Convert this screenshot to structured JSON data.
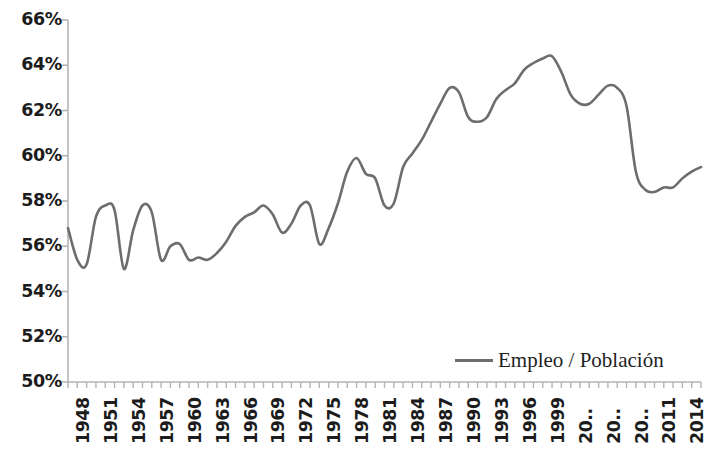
{
  "chart_data": {
    "type": "line",
    "title": "",
    "subtitle": "",
    "xlabel": "",
    "ylabel": "",
    "ylim": [
      50,
      66
    ],
    "xlim": [
      1948,
      2016
    ],
    "ytick_labels": [
      "66%",
      "64%",
      "62%",
      "60%",
      "58%",
      "56%",
      "54%",
      "52%",
      "50%"
    ],
    "ytick_values": [
      66,
      64,
      62,
      60,
      58,
      56,
      54,
      52,
      50
    ],
    "ytick_step": 2,
    "xtick_labels": [
      "1948",
      "1951",
      "1954",
      "1957",
      "1960",
      "1963",
      "1966",
      "1969",
      "1972",
      "1975",
      "1978",
      "1981",
      "1984",
      "1987",
      "1990",
      "1993",
      "1996",
      "1999",
      "20..",
      "20..",
      "20..",
      "2011",
      "2014"
    ],
    "xtick_years": [
      1948,
      1951,
      1954,
      1957,
      1960,
      1963,
      1966,
      1969,
      1972,
      1975,
      1978,
      1981,
      1984,
      1987,
      1990,
      1993,
      1996,
      1999,
      2002,
      2005,
      2008,
      2011,
      2014
    ],
    "xtick_label_rotation": -90,
    "minor_tick_interval_years": 1,
    "grid": false,
    "legend": {
      "position": "inside-bottom-right",
      "entries": [
        {
          "label": "Empleo / Población",
          "color": "#6d6d6d",
          "marker": "line"
        }
      ]
    },
    "line_color": "#6d6d6d",
    "line_width": 2.6,
    "axis_color": "#b5b5b5",
    "series": [
      {
        "name": "Empleo / Población",
        "x": [
          1948,
          1949,
          1950,
          1951,
          1952,
          1953,
          1954,
          1955,
          1956,
          1957,
          1958,
          1959,
          1960,
          1961,
          1962,
          1963,
          1964,
          1965,
          1966,
          1967,
          1968,
          1969,
          1970,
          1971,
          1972,
          1973,
          1974,
          1975,
          1976,
          1977,
          1978,
          1979,
          1980,
          1981,
          1982,
          1983,
          1984,
          1985,
          1986,
          1987,
          1988,
          1989,
          1990,
          1991,
          1992,
          1993,
          1994,
          1995,
          1996,
          1997,
          1998,
          1999,
          2000,
          2001,
          2002,
          2003,
          2004,
          2005,
          2006,
          2007,
          2008,
          2009,
          2010,
          2011,
          2012,
          2013,
          2014,
          2015,
          2016
        ],
        "values": [
          56.8,
          55.4,
          55.2,
          57.3,
          57.8,
          57.6,
          55.0,
          56.7,
          57.8,
          57.5,
          55.4,
          56.0,
          56.1,
          55.4,
          55.5,
          55.4,
          55.7,
          56.2,
          56.9,
          57.3,
          57.5,
          57.8,
          57.4,
          56.6,
          57.0,
          57.8,
          57.8,
          56.1,
          56.8,
          57.9,
          59.3,
          59.9,
          59.2,
          59.0,
          57.8,
          57.9,
          59.5,
          60.1,
          60.7,
          61.5,
          62.3,
          63.0,
          62.8,
          61.7,
          61.5,
          61.7,
          62.5,
          62.9,
          63.2,
          63.8,
          64.1,
          64.3,
          64.4,
          63.7,
          62.7,
          62.3,
          62.3,
          62.7,
          63.1,
          63.0,
          62.2,
          59.3,
          58.5,
          58.4,
          58.6,
          58.6,
          59.0,
          59.3,
          59.5
        ]
      }
    ]
  },
  "legend_label": "Empleo / Población"
}
